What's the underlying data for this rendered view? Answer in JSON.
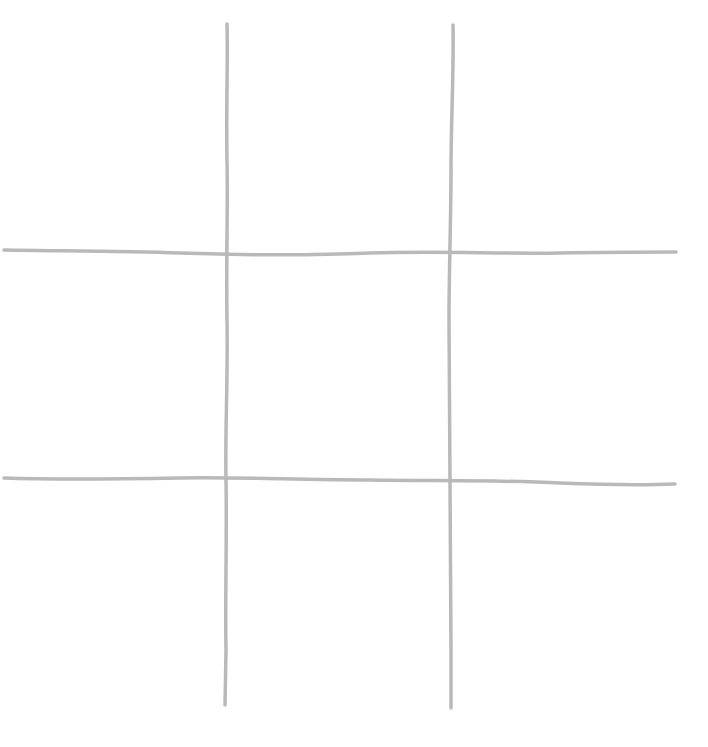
{
  "game": {
    "type": "tic-tac-toe",
    "board": [
      [
        "",
        "",
        ""
      ],
      [
        "",
        "",
        ""
      ],
      [
        "",
        "",
        ""
      ]
    ]
  },
  "style": {
    "line_color": "#b9b9b9",
    "background": "#ffffff"
  }
}
